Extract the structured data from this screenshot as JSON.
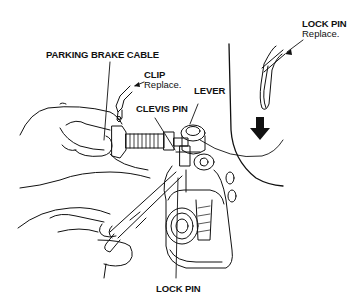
{
  "figure": {
    "labels": {
      "lock_pin_top": {
        "title": "LOCK PIN",
        "note": "Replace."
      },
      "parking_brake_cable": {
        "title": "PARKING BRAKE CABLE"
      },
      "clip": {
        "title": "CLIP",
        "note": "Replace."
      },
      "lever": {
        "title": "LEVER"
      },
      "clevis_pin": {
        "title": "CLEVIS PIN"
      },
      "lock_pin_bottom": {
        "title": "LOCK PIN"
      }
    },
    "colors": {
      "ink": "#111111",
      "paper": "#ffffff"
    }
  }
}
